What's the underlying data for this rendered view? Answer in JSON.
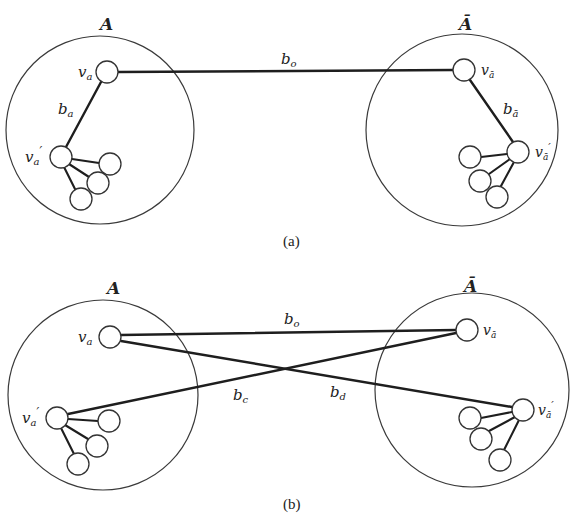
{
  "figure": {
    "panels": [
      {
        "id": "a",
        "caption": "(a)",
        "left_region": {
          "label": "A",
          "cx": 100,
          "cy": 130,
          "r": 94
        },
        "right_region": {
          "label": "Ā",
          "cx": 462,
          "cy": 130,
          "r": 96
        },
        "nodes": {
          "v_a": {
            "label": "v",
            "sub": "a",
            "prime": "",
            "cx": 107,
            "cy": 72
          },
          "v_a_prime": {
            "label": "v",
            "sub": "a",
            "prime": "′",
            "cx": 61,
            "cy": 157
          },
          "v_abar": {
            "label": "v",
            "sub": "ā",
            "prime": "",
            "cx": 464,
            "cy": 70
          },
          "v_abar_prime": {
            "label": "v",
            "sub": "ā",
            "prime": "′",
            "cx": 518,
            "cy": 152
          }
        },
        "edges": [
          {
            "name": "b_o",
            "label": "b",
            "sub": "o",
            "from": "v_a",
            "to": "v_abar"
          },
          {
            "name": "b_a",
            "label": "b",
            "sub": "a",
            "from": "v_a",
            "to": "v_a_prime"
          },
          {
            "name": "b_abar",
            "label": "b",
            "sub": "ā",
            "from": "v_abar",
            "to": "v_abar_prime"
          }
        ]
      },
      {
        "id": "b",
        "caption": "(b)",
        "left_region": {
          "label": "A",
          "cx": 103,
          "cy": 395,
          "r": 95
        },
        "right_region": {
          "label": "Ā",
          "cx": 472,
          "cy": 390,
          "r": 97
        },
        "nodes": {
          "v_a": {
            "label": "v",
            "sub": "a",
            "prime": "",
            "cx": 110,
            "cy": 337
          },
          "v_a_prime": {
            "label": "v",
            "sub": "a",
            "prime": "′",
            "cx": 57,
            "cy": 418
          },
          "v_abar": {
            "label": "v",
            "sub": "ā",
            "prime": "",
            "cx": 467,
            "cy": 330
          },
          "v_abar_prime": {
            "label": "v",
            "sub": "ā",
            "prime": "′",
            "cx": 523,
            "cy": 410
          }
        },
        "edges": [
          {
            "name": "b_o",
            "label": "b",
            "sub": "o",
            "from": "v_a",
            "to": "v_abar"
          },
          {
            "name": "b_c",
            "label": "b",
            "sub": "c",
            "from": "v_a_prime",
            "to": "v_abar"
          },
          {
            "name": "b_d",
            "label": "b",
            "sub": "d",
            "from": "v_a",
            "to": "v_abar_prime"
          }
        ]
      }
    ]
  }
}
